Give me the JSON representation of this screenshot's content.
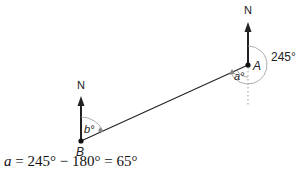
{
  "diagram": {
    "type": "bearing-diagram",
    "points": {
      "A": {
        "label": "A",
        "x": 248,
        "y": 65
      },
      "B": {
        "label": "B",
        "x": 81,
        "y": 141
      }
    },
    "north_labels": {
      "A": "N",
      "B": "N"
    },
    "angles": {
      "bearing_at_A": "245°",
      "a_label": "a°",
      "b_label": "b°"
    },
    "colors": {
      "line": "#222222",
      "arc": "#999999",
      "dotted": "#aaaaaa"
    }
  },
  "equation": {
    "var": "a",
    "text": " = 245° − 180° = 65°"
  }
}
